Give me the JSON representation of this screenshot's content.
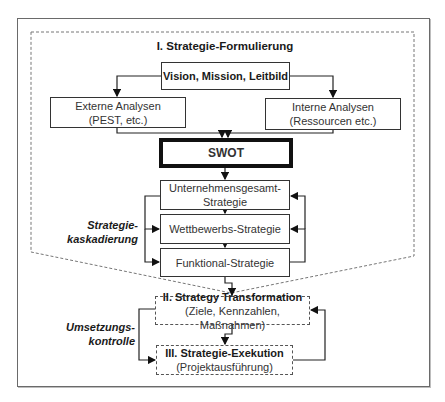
{
  "diagram": {
    "phase1": {
      "title": "I. Strategie-Formulierung",
      "vision": "Vision, Mission, Leitbild",
      "external": {
        "line1": "Externe Analysen",
        "line2": "(PEST, etc.)"
      },
      "internal": {
        "line1": "Interne Analysen",
        "line2": "(Ressourcen etc.)"
      },
      "swot": "SWOT",
      "cascade": {
        "label_line1": "Strategie-",
        "label_line2": "kaskadierung",
        "levels": [
          {
            "line1": "Unternehmensgesamt-",
            "line2": "Strategie"
          },
          {
            "line1": "Wettbewerbs-Strategie"
          },
          {
            "line1": "Funktional-Strategie"
          }
        ]
      }
    },
    "phase2": {
      "title": "II. Strategy Transformation",
      "subtitle": "(Ziele, Kennzahlen, Maßnahmen)"
    },
    "phase3": {
      "title": "III. Strategie-Exekution",
      "subtitle": "(Projektausführung)"
    },
    "control": {
      "label_line1": "Umsetzungs-",
      "label_line2": "kontrolle"
    }
  }
}
